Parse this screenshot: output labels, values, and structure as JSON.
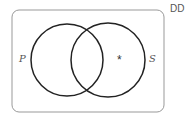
{
  "diagram": {
    "type": "venn",
    "corner_label": "DD",
    "sets": [
      {
        "name": "P",
        "label": "P"
      },
      {
        "name": "S",
        "label": "S"
      }
    ],
    "marker": {
      "symbol": "*",
      "region": "S only"
    },
    "colors": {
      "stroke": "#222222",
      "box": "#888888",
      "text": "#555555"
    }
  }
}
